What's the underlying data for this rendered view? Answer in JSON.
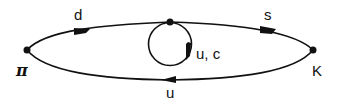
{
  "diagram": {
    "vertices": [
      {
        "id": "pi",
        "label": "π"
      },
      {
        "id": "K",
        "label": "K"
      },
      {
        "id": "loop_vertex",
        "label": ""
      }
    ],
    "edges": [
      {
        "id": "top_left",
        "from": "pi",
        "to": "loop_vertex",
        "label": "d"
      },
      {
        "id": "top_right",
        "from": "loop_vertex",
        "to": "K",
        "label": "s"
      },
      {
        "id": "bottom",
        "from": "K",
        "to": "pi",
        "label": "u"
      },
      {
        "id": "loop",
        "from": "loop_vertex",
        "to": "loop_vertex",
        "label": "u, c"
      }
    ],
    "colors": {
      "line": "#111111",
      "background": "#ffffff"
    }
  }
}
